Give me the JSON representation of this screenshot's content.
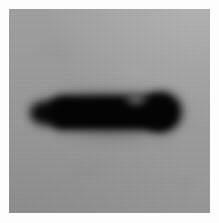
{
  "figure": {
    "kind": "western-blot-image",
    "width_px": 219,
    "height_px": 223,
    "caption": "",
    "lane_labels": [],
    "marker_labels": [],
    "annotations": []
  },
  "colors": {
    "page_background": "#ffffff",
    "scan_margin": "#fdfdfd",
    "membrane_background": "#9b9b9b",
    "membrane_light_region": "#a5a5a5",
    "membrane_dark_region": "#919191",
    "band_core": "#040404",
    "band_body": "#070707",
    "band_edge_halo": "#2c2c2c"
  },
  "geometry": {
    "margin": {
      "top_px": 9,
      "left_px": 9,
      "right_px": 9,
      "bottom_px": 10
    },
    "membrane": {
      "x_px": 9,
      "y_px": 9,
      "width_px": 201,
      "height_px": 204
    },
    "band": {
      "x_start_px": 35,
      "x_end_px": 173,
      "y_top_px": 93,
      "y_bottom_px": 132,
      "center_x_px": 104,
      "center_y_px": 112,
      "length_px": 138,
      "max_thickness_px": 39,
      "left_end_shape": "tapered-wedge",
      "right_end_shape": "rounded-blunt",
      "edge_blur_px": 5
    }
  },
  "chart_data": {
    "type": "heatmap",
    "title": "",
    "xlabel": "",
    "ylabel": "",
    "series": [
      {
        "name": "Band intensity profile (horizontal)",
        "x": [
          35,
          45,
          55,
          65,
          75,
          85,
          95,
          105,
          115,
          125,
          135,
          145,
          155,
          165,
          173
        ],
        "values": [
          18,
          78,
          95,
          98,
          99,
          99,
          98,
          97,
          94,
          96,
          98,
          99,
          97,
          80,
          20
        ]
      }
    ],
    "bands": [
      {
        "lane": 1,
        "label": "",
        "center_x_px": 104,
        "center_y_px": 112,
        "width_px": 138,
        "height_px": 39,
        "relative_intensity": 100,
        "mean_gray_value": 8
      }
    ],
    "background_gray_value": 155,
    "legend_position": "none",
    "grid": false
  }
}
